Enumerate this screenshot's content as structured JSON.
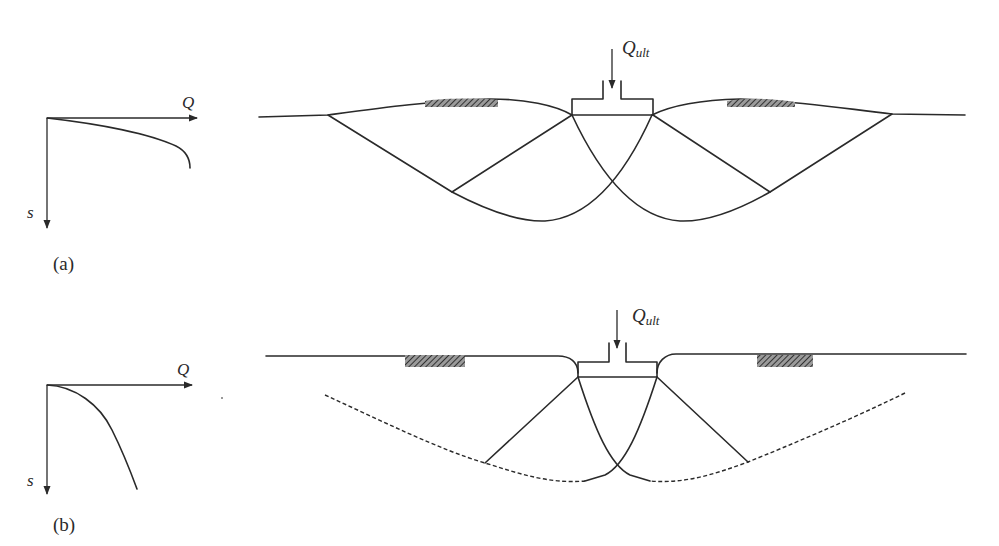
{
  "figure": {
    "panel_a": {
      "caption": "(a)",
      "graph": {
        "x_axis_label": "Q",
        "y_axis_label": "s",
        "curve": "load-settlement curve with sharp failure (general shear)"
      },
      "footing_load_label": {
        "main": "Q",
        "sub": "ult"
      },
      "failure_mode": "general shear failure with heave on both sides"
    },
    "panel_b": {
      "caption": "(b)",
      "graph": {
        "x_axis_label": "Q",
        "y_axis_label": "s",
        "curve": "load-settlement curve without distinct peak (local shear)"
      },
      "footing_load_label": {
        "main": "Q",
        "sub": "ult"
      },
      "failure_mode": "local shear failure with partially developed (dashed) slip surfaces"
    },
    "colors": {
      "line": "#2a2a2a",
      "hatch": "#555555",
      "background": "#ffffff"
    }
  }
}
